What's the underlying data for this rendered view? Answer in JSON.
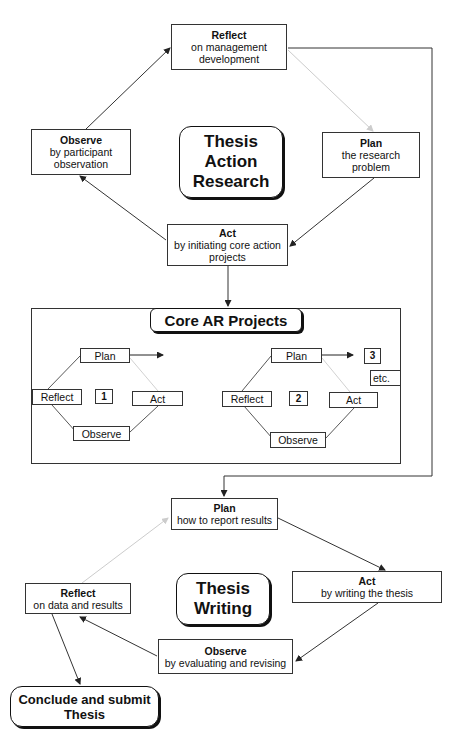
{
  "diagram": {
    "top_cycle": {
      "title": [
        "Thesis",
        "Action",
        "Research"
      ],
      "reflect": {
        "heading": "Reflect",
        "lines": [
          "on management",
          "development"
        ]
      },
      "plan": {
        "heading": "Plan",
        "lines": [
          "the research",
          "problem"
        ]
      },
      "act": {
        "heading": "Act",
        "lines": [
          "by initiating core action",
          "projects"
        ]
      },
      "observe": {
        "heading": "Observe",
        "lines": [
          "by participant",
          "observation"
        ]
      }
    },
    "core_projects": {
      "title": "Core AR Projects",
      "cycle1": {
        "number": "1",
        "plan": "Plan",
        "act": "Act",
        "observe": "Observe",
        "reflect": "Reflect"
      },
      "cycle2": {
        "number": "2",
        "plan": "Plan",
        "act": "Act",
        "observe": "Observe",
        "reflect": "Reflect"
      },
      "next_number": "3",
      "etc": "etc."
    },
    "bottom_cycle": {
      "title": [
        "Thesis",
        "Writing"
      ],
      "plan": {
        "heading": "Plan",
        "lines": [
          "how to report results"
        ]
      },
      "act": {
        "heading": "Act",
        "lines": [
          "by writing the thesis"
        ]
      },
      "observe": {
        "heading": "Observe",
        "lines": [
          "by evaluating and revising"
        ]
      },
      "reflect": {
        "heading": "Reflect",
        "lines": [
          "on data and results"
        ]
      }
    },
    "conclusion": [
      "Conclude and submit",
      "Thesis"
    ],
    "colors": {
      "line": "#333333",
      "faint_line": "#cfcfcf",
      "shadow": "#111111"
    }
  }
}
